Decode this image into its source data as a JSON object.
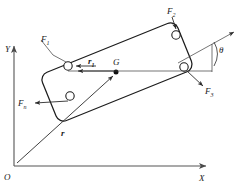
{
  "figure": {
    "type": "free-body-diagram"
  },
  "axes": {
    "x_label": "X",
    "y_label": "Y",
    "origin_label": "O",
    "origin": {
      "x": 14,
      "y": 166
    },
    "x_axis_end": {
      "x": 212,
      "y": 166
    },
    "y_axis_end": {
      "x": 14,
      "y": 40
    }
  },
  "body": {
    "name": "plate",
    "center_label": "G",
    "center": {
      "x": 117,
      "y": 72
    },
    "tilt_degrees": 22,
    "corner_radius": 7,
    "half_length": 73,
    "half_width": 26
  },
  "holes": [
    {
      "name": "hole-f1",
      "x": 68,
      "y": 66,
      "r": 4.2
    },
    {
      "name": "hole-f2",
      "x": 176,
      "y": 35,
      "r": 4.2
    },
    {
      "name": "hole-f3",
      "x": 184,
      "y": 67,
      "r": 4.2
    },
    {
      "name": "hole-fn",
      "x": 70,
      "y": 96,
      "r": 4.2
    }
  ],
  "forces": [
    {
      "id": "F1",
      "label": "F",
      "subscript": "1",
      "label_pos": {
        "x": 44,
        "y": 45
      },
      "arrow_from": {
        "x": 92,
        "y": 66
      },
      "arrow_to": {
        "x": 74,
        "y": 66
      },
      "note": "horizontal arrow pointing left into upper-left hole"
    },
    {
      "id": "F2",
      "label": "F",
      "subscript": "2",
      "label_pos": {
        "x": 173,
        "y": 12
      },
      "arrow_from": {
        "x": 176,
        "y": 16
      },
      "arrow_to": {
        "x": 176,
        "y": 30
      },
      "note": "arrow pointing down into top-right hole"
    },
    {
      "id": "F3",
      "label": "F",
      "subscript": "3",
      "label_pos": {
        "x": 206,
        "y": 92
      },
      "arrow_from": {
        "x": 187,
        "y": 71
      },
      "arrow_to": {
        "x": 204,
        "y": 87
      },
      "note": "arrow pointing down-right out of right hole"
    },
    {
      "id": "Fn",
      "label": "F",
      "subscript": "n",
      "label_pos": {
        "x": 21,
        "y": 107
      },
      "arrow_from": {
        "x": 66,
        "y": 101
      },
      "arrow_to": {
        "x": 34,
        "y": 103
      },
      "note": "arrow pointing left out of lower-left hole"
    }
  ],
  "vectors": [
    {
      "id": "r",
      "label": "r",
      "label_pos": {
        "x": 63,
        "y": 133
      },
      "from": {
        "x": 16,
        "y": 164
      },
      "to": {
        "x": 115,
        "y": 75
      },
      "note": "position vector from origin O to center of mass G"
    },
    {
      "id": "r1",
      "label": "r",
      "subscript": "1",
      "label_pos": {
        "x": 91,
        "y": 62
      },
      "from": {
        "x": 114,
        "y": 71
      },
      "to": {
        "x": 75,
        "y": 71
      },
      "note": "position vector from G to point of application of F1"
    }
  ],
  "angle": {
    "label": "θ",
    "label_pos": {
      "x": 221,
      "y": 50
    },
    "vertex": {
      "x": 184,
      "y": 67
    },
    "reference_line_to": {
      "x": 233,
      "y": 33
    },
    "note": "angle between body axis and horizontal reference"
  },
  "colors": {
    "body_stroke": "#1d1d1d",
    "vector_stroke": "#2b2b2b",
    "axis_stroke": "#555555",
    "hole_fill": "#ffffff",
    "center_dot": "#111111",
    "background": "#ffffff"
  }
}
